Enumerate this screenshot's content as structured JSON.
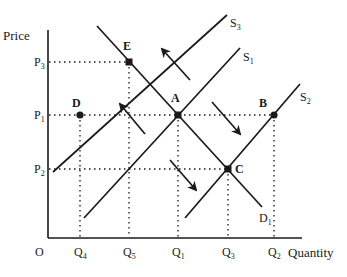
{
  "diagram": {
    "type": "supply-demand",
    "axes": {
      "y_label": "Price",
      "x_label": "Quantity",
      "origin": "O"
    },
    "price_levels": [
      {
        "id": "P3",
        "main": "P",
        "sub": "3"
      },
      {
        "id": "P1",
        "main": "P",
        "sub": "1"
      },
      {
        "id": "P2",
        "main": "P",
        "sub": "2"
      }
    ],
    "quantity_levels": [
      {
        "id": "Q4",
        "main": "Q",
        "sub": "4"
      },
      {
        "id": "Q5",
        "main": "Q",
        "sub": "5"
      },
      {
        "id": "Q1",
        "main": "Q",
        "sub": "1"
      },
      {
        "id": "Q3",
        "main": "Q",
        "sub": "3"
      },
      {
        "id": "Q2",
        "main": "Q",
        "sub": "2"
      }
    ],
    "curves": [
      {
        "id": "S3",
        "main": "S",
        "sub": "3"
      },
      {
        "id": "S1",
        "main": "S",
        "sub": "1"
      },
      {
        "id": "S2",
        "main": "S",
        "sub": "2"
      },
      {
        "id": "D1",
        "main": "D",
        "sub": "1"
      }
    ],
    "points": [
      {
        "id": "E",
        "label": "E",
        "price": "P3",
        "quantity": "Q5"
      },
      {
        "id": "D",
        "label": "D",
        "price": "P1",
        "quantity": "Q4"
      },
      {
        "id": "A",
        "label": "A",
        "price": "P1",
        "quantity": "Q1"
      },
      {
        "id": "B",
        "label": "B",
        "price": "P1",
        "quantity": "Q2"
      },
      {
        "id": "C",
        "label": "C",
        "price": "P2",
        "quantity": "Q3"
      }
    ],
    "arrows": [
      {
        "id": "arrow-s1-to-s3-upper",
        "direction": "up-left"
      },
      {
        "id": "arrow-s1-to-s3-lower",
        "direction": "up-left"
      },
      {
        "id": "arrow-s1-to-s2-upper",
        "direction": "down-right"
      },
      {
        "id": "arrow-s1-to-s2-lower",
        "direction": "down-right"
      }
    ],
    "colors": {
      "ink": "#1a1a1a",
      "background": "#ffffff"
    }
  }
}
